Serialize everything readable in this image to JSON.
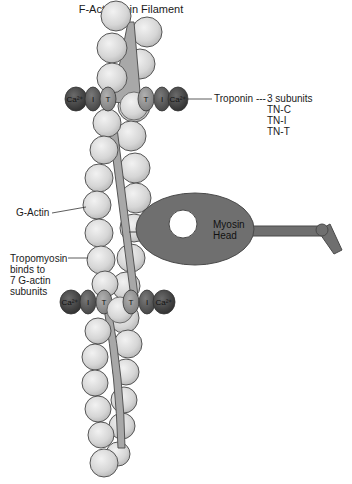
{
  "title": "F-Actin/Thin Filament",
  "labels": {
    "troponin": "Troponin ---",
    "troponin_subunits": [
      "3 subunits",
      "TN-C",
      "TN-I",
      "TN-T"
    ],
    "g_actin": "G-Actin",
    "tropomyosin": [
      "Tropomyosin",
      "binds to",
      "7 G-actin",
      "subunits"
    ],
    "myosin_head": [
      "Myosin",
      "Head"
    ]
  },
  "troponin_complex": {
    "subunit_labels": {
      "calcium": "Ca²⁺",
      "inhibitory": "I",
      "tropomyosin_binding": "T"
    },
    "complexes": [
      {
        "position": "upper",
        "order": [
          "Ca²⁺",
          "I",
          "T",
          "T",
          "I",
          "Ca²⁺"
        ]
      },
      {
        "position": "lower",
        "order": [
          "Ca²⁺",
          "I",
          "T",
          "T",
          "I",
          "Ca²⁺"
        ]
      }
    ]
  },
  "colors": {
    "actin_fill": "#dcdcdc",
    "actin_stroke": "#555555",
    "tropomyosin_fill": "#a8a8a8",
    "troponin_dark": "#3e3e3e",
    "troponin_mid": "#5a5a5a",
    "troponin_t": "#8c8c8c",
    "myosin_fill": "#6f6f6f",
    "myosin_stroke": "#4a4a4a"
  }
}
